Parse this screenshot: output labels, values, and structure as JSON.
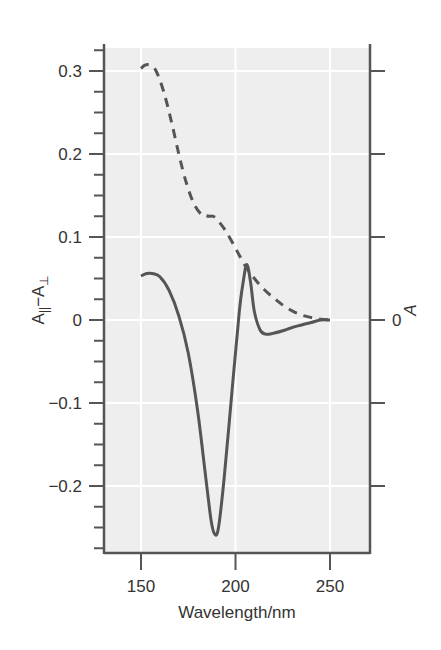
{
  "chart_data": {
    "type": "line",
    "title": "",
    "xlabel": "Wavelength/nm",
    "ylabel": "A|| −A⊥",
    "ylabel_parts": {
      "a": "A",
      "sub_par": "||",
      "minus": "−A",
      "sub_perp": "⊥"
    },
    "ylabel_right": "A",
    "right_axis_zero_label": "0",
    "xlim": [
      130,
      270
    ],
    "ylim": [
      -0.28,
      0.33
    ],
    "x_ticks": [
      150,
      200,
      250
    ],
    "x_tick_labels": [
      "150",
      "200",
      "250"
    ],
    "y_ticks": [
      0.3,
      0.2,
      0.1,
      0,
      -0.1,
      -0.2
    ],
    "y_tick_labels": [
      "0.3",
      "0.2",
      "0.1",
      "0",
      "−0.1",
      "−0.2"
    ],
    "grid": true,
    "legend": null,
    "series": [
      {
        "name": "Linear dichroism (A|| − A⊥)",
        "style": "solid",
        "axis": "left",
        "x": [
          150,
          153,
          156,
          160,
          165,
          170,
          175,
          180,
          184,
          187,
          189,
          191,
          194,
          198,
          202,
          204,
          206,
          208,
          210,
          213,
          216,
          220,
          225,
          230,
          235,
          240,
          245,
          250
        ],
        "y": [
          0.053,
          0.056,
          0.056,
          0.052,
          0.035,
          0.005,
          -0.04,
          -0.11,
          -0.185,
          -0.24,
          -0.258,
          -0.25,
          -0.19,
          -0.09,
          0.01,
          0.045,
          0.067,
          0.045,
          0.01,
          -0.012,
          -0.017,
          -0.016,
          -0.013,
          -0.009,
          -0.006,
          -0.003,
          0,
          0
        ]
      },
      {
        "name": "Absorbance (A)",
        "style": "dashed",
        "axis": "right",
        "x": [
          150,
          152,
          155,
          158,
          162,
          166,
          170,
          174,
          178,
          182,
          184,
          186,
          188,
          190,
          194,
          198,
          202,
          206,
          210,
          215,
          220,
          225,
          230,
          235,
          240,
          245,
          250
        ],
        "y": [
          0.303,
          0.307,
          0.307,
          0.3,
          0.275,
          0.24,
          0.2,
          0.165,
          0.14,
          0.127,
          0.126,
          0.125,
          0.125,
          0.122,
          0.11,
          0.095,
          0.078,
          0.062,
          0.05,
          0.037,
          0.027,
          0.018,
          0.011,
          0.006,
          0.003,
          0.001,
          0
        ]
      }
    ],
    "colors": {
      "plot_background": "#eeeeee",
      "grid": "#ffffff",
      "axis": "#555555",
      "line": "#555555"
    }
  }
}
